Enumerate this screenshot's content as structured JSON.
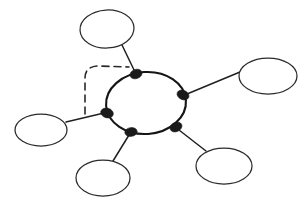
{
  "figure": {
    "background_color": "#ffffff",
    "width": 307,
    "height": 205
  },
  "style": {
    "hub_stroke_color": "#151515",
    "satellite_stroke_color": "#2b2b2b",
    "edge_stroke_color": "#202020",
    "node_fill_color": "#1a1a1a",
    "dashed_edge_color": "#2a2a2a",
    "ellipse_fill": "#ffffff"
  },
  "hub": {
    "name": "central-ring",
    "label": "",
    "cx": 146,
    "cy": 103,
    "rx": 40,
    "ry": 31,
    "rotation": -4
  },
  "junctions": [
    {
      "id": "junction-top",
      "label": "",
      "cx": 136,
      "cy": 74,
      "rx": 6.2,
      "ry": 4.6,
      "rotation": -20
    },
    {
      "id": "junction-right",
      "label": "",
      "cx": 183,
      "cy": 95,
      "rx": 6.2,
      "ry": 4.6,
      "rotation": 25
    },
    {
      "id": "junction-left",
      "label": "",
      "cx": 107,
      "cy": 113,
      "rx": 6.4,
      "ry": 4.8,
      "rotation": 15
    },
    {
      "id": "junction-bottom-left",
      "label": "",
      "cx": 131,
      "cy": 132,
      "rx": 6.2,
      "ry": 4.4,
      "rotation": -8
    },
    {
      "id": "junction-bottom-right",
      "label": "",
      "cx": 176,
      "cy": 127,
      "rx": 6.2,
      "ry": 4.6,
      "rotation": -25
    }
  ],
  "satellites": [
    {
      "id": "satellite-top",
      "label": "",
      "cx": 107,
      "cy": 29,
      "rx": 27,
      "ry": 19,
      "rotation": -3
    },
    {
      "id": "satellite-right",
      "label": "",
      "cx": 268,
      "cy": 76,
      "rx": 29,
      "ry": 18,
      "rotation": 0
    },
    {
      "id": "satellite-left",
      "label": "",
      "cx": 41,
      "cy": 130,
      "rx": 26,
      "ry": 16,
      "rotation": 0
    },
    {
      "id": "satellite-bottom-left",
      "label": "",
      "cx": 103,
      "cy": 178,
      "rx": 27,
      "ry": 18,
      "rotation": 0
    },
    {
      "id": "satellite-bottom-right",
      "label": "",
      "cx": 224,
      "cy": 166,
      "rx": 28,
      "ry": 18,
      "rotation": 0
    }
  ],
  "edges": [
    {
      "id": "edge-top",
      "from": "satellite-top",
      "to": "junction-top",
      "x1": 122,
      "y1": 45,
      "x2": 135,
      "y2": 72,
      "style": "solid"
    },
    {
      "id": "edge-right",
      "from": "junction-right",
      "to": "satellite-right",
      "x1": 187,
      "y1": 94,
      "x2": 240,
      "y2": 72,
      "style": "solid"
    },
    {
      "id": "edge-left",
      "from": "satellite-left",
      "to": "junction-left",
      "x1": 66,
      "y1": 122,
      "x2": 104,
      "y2": 113,
      "style": "solid"
    },
    {
      "id": "edge-bottom-left",
      "from": "junction-bottom-left",
      "to": "satellite-bottom-left",
      "x1": 129,
      "y1": 135,
      "x2": 113,
      "y2": 161,
      "style": "solid"
    },
    {
      "id": "edge-bottom-right",
      "from": "junction-bottom-right",
      "to": "satellite-bottom-right",
      "x1": 179,
      "y1": 130,
      "x2": 206,
      "y2": 151,
      "style": "solid"
    }
  ],
  "dashed_edge": {
    "id": "dashed-shortcut-edge",
    "from": "junction-left",
    "to": "edge-top",
    "style": "dashed",
    "path": "M 85 114 L 85 78 Q 85 67 97 66 L 129 67",
    "dash_pattern": "7 5"
  }
}
